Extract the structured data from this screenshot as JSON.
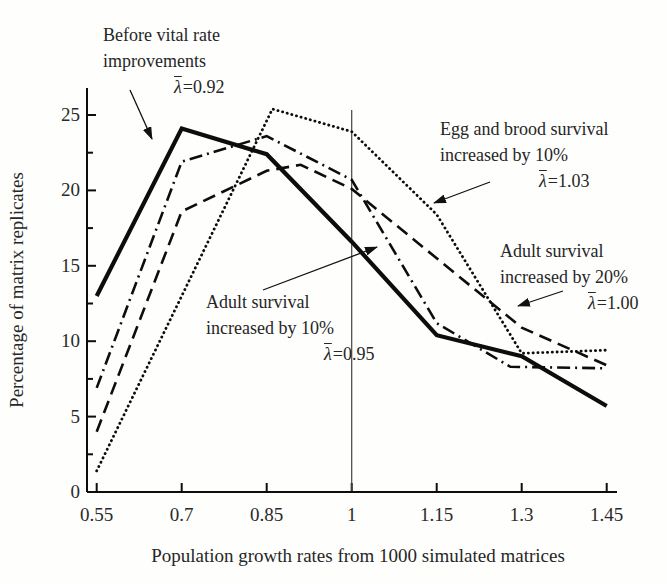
{
  "figure": {
    "background": "#fefefd",
    "ink_color": "#0d0d0d",
    "text_color": "#262626",
    "reference_line_color": "#444444"
  },
  "chart_data": {
    "type": "line",
    "title": "",
    "xlabel": "Population growth rates from 1000 simulated matrices",
    "ylabel": "Percentage of matrix replicates",
    "xlim": [
      0.55,
      1.45
    ],
    "ylim": [
      0,
      25
    ],
    "grid": false,
    "legend_position": "none (inline annotations with arrows)",
    "x_ticks": [
      0.55,
      0.7,
      0.85,
      1,
      1.15,
      1.3,
      1.45
    ],
    "x_tick_labels": [
      "0.55",
      "0.7",
      "0.85",
      "1",
      "1.15",
      "1.3",
      "1.45"
    ],
    "y_ticks": [
      0,
      5,
      10,
      15,
      20,
      25
    ],
    "y_tick_labels": [
      "0",
      "5",
      "10",
      "15",
      "20",
      "25"
    ],
    "y_minor_ticks": [
      2.5,
      7.5,
      12.5,
      17.5,
      22.5
    ],
    "reference_line_x": 1,
    "series": [
      {
        "name": "Egg and brood survival increased by 10%",
        "mean_lambda": "1.03",
        "style": "dotted",
        "x": [
          0.55,
          0.7,
          0.86,
          1,
          1.15,
          1.3,
          1.45
        ],
        "y": [
          1.4,
          13.0,
          25.4,
          23.9,
          18.4,
          9.2,
          9.4
        ]
      },
      {
        "name": "Adult survival increased by 20%",
        "mean_lambda": "1.00",
        "style": "dashed",
        "x": [
          0.55,
          0.7,
          0.85,
          0.91,
          1,
          1.15,
          1.3,
          1.45
        ],
        "y": [
          4.0,
          18.6,
          21.3,
          21.7,
          20.1,
          15.5,
          10.9,
          8.4
        ]
      },
      {
        "name": "Adult survival increased by 10%",
        "mean_lambda": "0.95",
        "style": "dashdot",
        "x": [
          0.55,
          0.7,
          0.85,
          1,
          1.15,
          1.28,
          1.45
        ],
        "y": [
          6.9,
          21.9,
          23.6,
          20.7,
          11.2,
          8.3,
          8.2
        ]
      },
      {
        "name": "Before vital rate improvements",
        "mean_lambda": "0.92",
        "style": "solid",
        "x": [
          0.55,
          0.7,
          0.85,
          1,
          1.15,
          1.3,
          1.45
        ],
        "y": [
          13.0,
          24.1,
          22.4,
          16.6,
          10.4,
          9.0,
          5.7
        ]
      }
    ]
  },
  "annotations": [
    {
      "id": "before",
      "line1": "Before vital rate",
      "line2": "improvements",
      "lambda_symbol": "λ",
      "lambda_value": "=0.92"
    },
    {
      "id": "egg",
      "line1": "Egg and brood survival",
      "line2": "increased by 10%",
      "lambda_symbol": "λ",
      "lambda_value": "=1.03"
    },
    {
      "id": "adult20",
      "line1": "Adult survival",
      "line2": "increased by 20%",
      "lambda_symbol": "λ",
      "lambda_value": "=1.00"
    },
    {
      "id": "adult10",
      "line1": "Adult survival",
      "line2": "increased by 10%",
      "lambda_symbol": "λ",
      "lambda_value": "=0.95"
    }
  ]
}
